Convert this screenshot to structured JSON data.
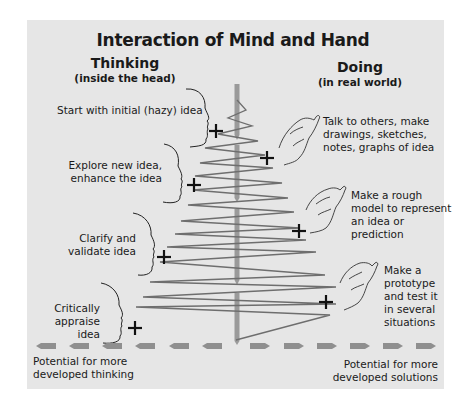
{
  "title": "Interaction of Mind and Hand",
  "columns": {
    "thinking": {
      "heading": "Thinking",
      "subheading": "(inside the head)"
    },
    "doing": {
      "heading": "Doing",
      "subheading": "(in real world)"
    }
  },
  "thinking_steps": [
    {
      "label": "Start with initial (hazy) idea"
    },
    {
      "label_lines": [
        "Explore new idea,",
        "enhance the idea"
      ]
    },
    {
      "label_lines": [
        "Clarify and",
        "validate idea"
      ]
    },
    {
      "label_lines": [
        "Critically",
        "appraise idea"
      ]
    }
  ],
  "doing_steps": [
    {
      "label_lines": [
        "Talk to others, make",
        "drawings, sketches,",
        "notes, graphs of idea"
      ]
    },
    {
      "label_lines": [
        "Make a rough",
        "model to represent",
        "an idea or",
        "prediction"
      ]
    },
    {
      "label_lines": [
        "Make a",
        "prototype",
        "and test it",
        "in several",
        "situations"
      ]
    }
  ],
  "axis": {
    "left_label_lines": [
      "Potential for more",
      "developed thinking"
    ],
    "right_label_lines": [
      "Potential for more",
      "developed solutions"
    ]
  },
  "icons": {
    "plus": "plus-marker-icon",
    "head": "head-profile-icon",
    "hand": "hand-icon"
  },
  "colors": {
    "panel_bg": "#e6e6e6",
    "zigzag": "#6e6e6e",
    "center_arrow": "#9a9a9a",
    "dashed_arrow": "#8f8f8f",
    "text": "#1a1a1a"
  }
}
